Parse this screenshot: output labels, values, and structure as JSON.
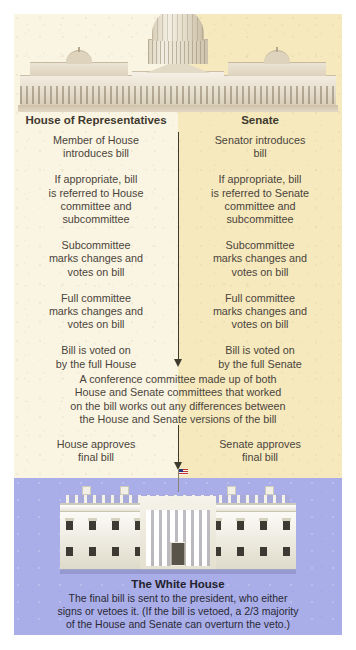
{
  "figure": {
    "colors": {
      "legislative_left_bg": "#faf5e2",
      "legislative_right_bg": "#f6e9bd",
      "executive_bg": "#a9aee8",
      "text": "#4a443c",
      "heading": "#3f392f",
      "arrow": "#3d3a30",
      "caption_text": "#2a2935"
    }
  },
  "capitol": {
    "alt": "United States Capitol building illustration"
  },
  "columns": {
    "left": {
      "heading": "House of Representatives",
      "steps": [
        [
          "Member of House",
          "introduces bill"
        ],
        [
          "If appropriate, bill",
          "is referred to House",
          "committee and",
          "subcommittee"
        ],
        [
          "Subcommittee",
          "marks changes and",
          "votes on bill"
        ],
        [
          "Full committee",
          "marks changes and",
          "votes on bill"
        ],
        [
          "Bill is voted on",
          "by the full House"
        ]
      ],
      "approval": [
        "House approves",
        "final bill"
      ]
    },
    "right": {
      "heading": "Senate",
      "steps": [
        [
          "Senator introduces",
          "bill"
        ],
        [
          "If appropriate, bill",
          "is referred to Senate",
          "committee and",
          "subcommittee"
        ],
        [
          "Subcommittee",
          "marks changes and",
          "votes on bill"
        ],
        [
          "Full committee",
          "marks changes and",
          "votes on bill"
        ],
        [
          "Bill is voted on",
          "by the full Senate"
        ]
      ],
      "approval": [
        "Senate approves",
        "final bill"
      ]
    }
  },
  "conference": {
    "lines": [
      "A conference committee made up of both",
      "House and Senate committees that worked",
      "on the bill works out any differences between",
      "the House and Senate versions of the bill"
    ]
  },
  "flag": {
    "alt": "United States flag on pole"
  },
  "white_house": {
    "alt": "The White House building illustration",
    "title": "The White House",
    "caption": [
      "The final bill is sent to the president, who either",
      "signs or vetoes it. (If the bill is vetoed, a 2/3 majority",
      "of the House and Senate can overturn the veto.)"
    ]
  }
}
